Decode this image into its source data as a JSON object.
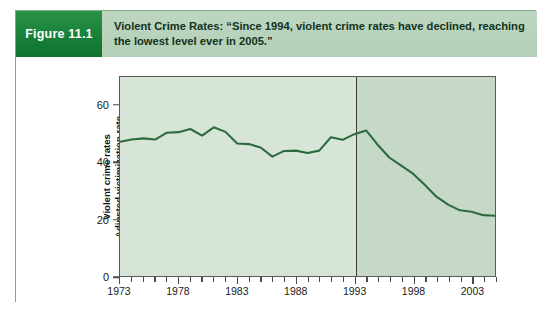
{
  "figure": {
    "badge_label": "Figure 11.1",
    "caption": "Violent Crime Rates: “Since 1994, violent crime rates have declined, reaching the lowest level ever in 2005.”",
    "badge_color": "#17803a",
    "caption_bg": "#b9d3bc",
    "border_color": "#7fae86"
  },
  "chart_data": {
    "type": "line",
    "title": "",
    "xlabel": "",
    "ylabel": "Violent crime rates Adjusted victimization rate per 1,000 persons age 12 and over",
    "ylabel_lines": [
      "Violent crime rates",
      "Adjusted victimization rate",
      "per 1,000 persons age 12 and over"
    ],
    "xlim": [
      1973,
      2005
    ],
    "ylim": [
      0,
      70
    ],
    "yticks": [
      0,
      20,
      40,
      60
    ],
    "ytick_labels": [
      "0",
      "20",
      "40",
      "60"
    ],
    "xticks": [
      1973,
      1974,
      1975,
      1976,
      1977,
      1978,
      1979,
      1980,
      1981,
      1982,
      1983,
      1984,
      1985,
      1986,
      1987,
      1988,
      1989,
      1990,
      1991,
      1992,
      1993,
      1994,
      1995,
      1996,
      1997,
      1998,
      1999,
      2000,
      2001,
      2002,
      2003,
      2004,
      2005
    ],
    "xtick_labels": [
      "1973",
      "1978",
      "1983",
      "1988",
      "1993",
      "1998",
      "2003"
    ],
    "xtick_label_values": [
      1973,
      1978,
      1983,
      1988,
      1993,
      1998,
      2003
    ],
    "grid": false,
    "legend": null,
    "line_color": "#2d6b3f",
    "plot_bg_left": "#d6e5d7",
    "plot_bg_right": "#c6d8c7",
    "divider_x": 1993,
    "x": [
      1973,
      1974,
      1975,
      1976,
      1977,
      1978,
      1979,
      1980,
      1981,
      1982,
      1983,
      1984,
      1985,
      1986,
      1987,
      1988,
      1989,
      1990,
      1991,
      1992,
      1993,
      1994,
      1995,
      1996,
      1997,
      1998,
      1999,
      2000,
      2001,
      2002,
      2003,
      2004,
      2005
    ],
    "values": [
      47.2,
      48.0,
      48.4,
      48.0,
      50.4,
      50.6,
      51.7,
      49.4,
      52.3,
      50.7,
      46.6,
      46.4,
      45.2,
      42.0,
      44.0,
      44.1,
      43.3,
      44.1,
      48.8,
      47.9,
      49.9,
      51.2,
      46.1,
      41.6,
      38.8,
      36.0,
      32.1,
      27.9,
      25.1,
      23.1,
      22.6,
      21.4,
      21.2
    ],
    "annotations": []
  }
}
